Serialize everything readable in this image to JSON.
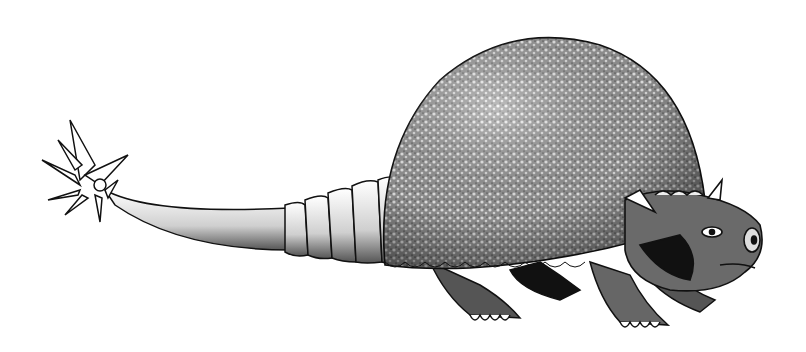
{
  "image": {
    "subject": "Pen-and-ink illustration of a glyptodont (Doedicurus) with domed armored shell and spiked club tail",
    "style": "black ink stipple on white",
    "colors": {
      "background": "#ffffff",
      "ink": "#111111",
      "shell_fill": "#8a8a8a"
    }
  }
}
